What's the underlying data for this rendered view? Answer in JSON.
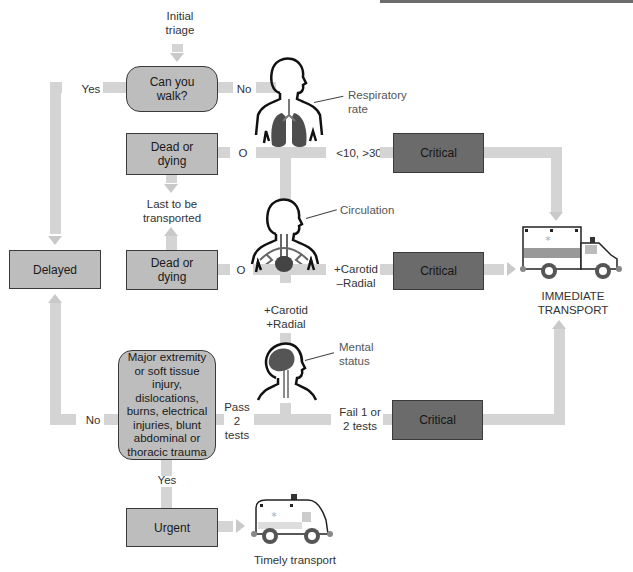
{
  "start": {
    "label": "Initial\ntriage"
  },
  "nodes": {
    "walk": {
      "label": "Can you walk?",
      "line1": "Can you",
      "line2": "walk?"
    },
    "dead1": {
      "line1": "Dead or",
      "line2": "dying"
    },
    "dead2": {
      "line1": "Dead or",
      "line2": "dying"
    },
    "delayed": {
      "label": "Delayed"
    },
    "critical1": {
      "label": "Critical"
    },
    "critical2": {
      "label": "Critical"
    },
    "critical3": {
      "label": "Critical"
    },
    "major": {
      "lines": [
        "Major extremity",
        "or soft tissue",
        "injury, dislocations,",
        "burns, electrical",
        "injuries, blunt",
        "abdominal or",
        "thoracic trauma"
      ]
    },
    "urgent": {
      "label": "Urgent"
    }
  },
  "edges": {
    "yes_walk": "Yes",
    "no_walk": "No",
    "o1": "O",
    "o2": "O",
    "resp_rate": "<10, >30",
    "last1": "Last to be",
    "last2": "transported",
    "carotid_minus1": "+Carotid",
    "carotid_minus2": "–Radial",
    "carotid_plus1": "+Carotid",
    "carotid_plus2": "+Radial",
    "pass1": "Pass",
    "pass2": "2",
    "pass3": "tests",
    "fail1": "Fail 1 or",
    "fail2": "2 tests",
    "no_major": "No",
    "yes_major": "Yes"
  },
  "figures": {
    "respiratory": {
      "label1": "Respiratory",
      "label2": "rate",
      "icon": "lungs-figure"
    },
    "circulation": {
      "label": "Circulation",
      "icon": "heart-figure"
    },
    "mental": {
      "label1": "Mental",
      "label2": "status",
      "icon": "brain-figure"
    }
  },
  "transport": {
    "immediate1": "IMMEDIATE",
    "immediate2": "TRANSPORT",
    "timely": "Timely transport"
  },
  "colors": {
    "connector": "#d4d4d4",
    "light_box": "#bdbdbd",
    "dark_box": "#6b6b6b",
    "organ": "#555555"
  }
}
